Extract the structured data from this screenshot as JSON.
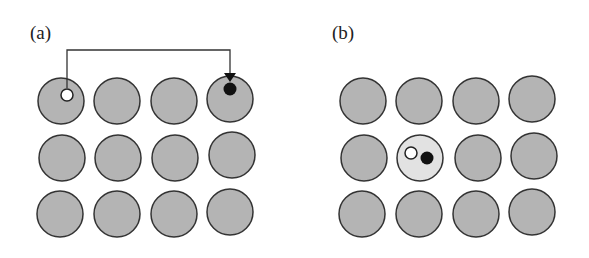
{
  "panels": [
    {
      "label": "(a)",
      "description": "4x3 lattice of grey atoms; a hole (white) in top-left atom and an electron (black) in top-right atom, connected by a bracket arrow indicating charge transfer",
      "grid": {
        "cols": 4,
        "rows": 3
      },
      "hole_site": {
        "row": 0,
        "col": 0
      },
      "electron_site": {
        "row": 0,
        "col": 3
      },
      "arrow": "from hole site to electron site"
    },
    {
      "label": "(b)",
      "description": "4x3 lattice of grey atoms; hole (white) and electron (black) bound together on one light-grey excited atom",
      "grid": {
        "cols": 4,
        "rows": 3
      },
      "excited_site": {
        "row": 1,
        "col": 1
      }
    }
  ],
  "colors": {
    "atom_fill": "#b4b4b4",
    "atom_stroke": "#333333",
    "excited_atom_fill": "#e2e2e2",
    "hole_fill": "#ffffff",
    "electron_fill": "#111111",
    "line": "#333333"
  }
}
